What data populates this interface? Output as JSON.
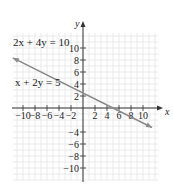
{
  "chart_data": {
    "type": "line",
    "title": "",
    "xlabel": "x",
    "ylabel": "y",
    "xlim": [
      -12,
      13
    ],
    "ylim": [
      -12,
      14
    ],
    "grid": true,
    "x_ticks": [
      -10,
      -8,
      -6,
      -4,
      -2,
      2,
      4,
      6,
      8,
      10
    ],
    "y_ticks": [
      10,
      8,
      6,
      4,
      2,
      -4,
      -6,
      -8,
      -10
    ],
    "x_tick_labels": [
      "−10",
      "−8",
      "−6",
      "−4",
      "−2",
      "2",
      "4",
      "6",
      "8",
      "10"
    ],
    "y_tick_labels": [
      "10",
      "8",
      "6",
      "4",
      "2",
      "−4",
      "−6",
      "−8",
      "−10"
    ],
    "series": [
      {
        "name": "x + 2y = 5 (same line as 2x + 4y = 10)",
        "equation": "y = -x/2 + 5/2",
        "x": [
          -11.7,
          11.5
        ],
        "y": [
          8.35,
          -3.25
        ],
        "color": "#8a8a8a",
        "arrows": "both"
      }
    ],
    "annotations": [
      {
        "text": "2x + 4y = 10",
        "x": -11,
        "y": 10
      },
      {
        "text": "x + 2y = 5",
        "x": -11,
        "y": 4
      }
    ]
  },
  "labels": {
    "eq1": "2x + 4y = 10",
    "eq2": "x + 2y = 5",
    "x_axis": "x",
    "y_axis": "y"
  },
  "colors": {
    "grid": "#e4e4e4",
    "axis": "#333333",
    "line": "#8a8a8a"
  }
}
